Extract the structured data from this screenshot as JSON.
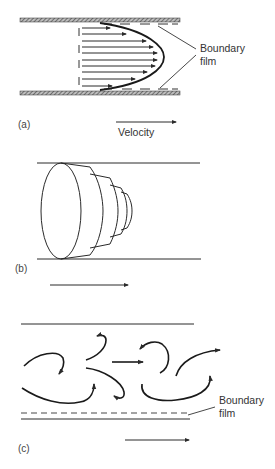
{
  "figure": {
    "panels": [
      {
        "id": "a",
        "label": "(a)",
        "description": "Laminar flow in a pipe: parabolic velocity profile with boundary film at walls",
        "annotation": {
          "line1": "Boundary",
          "line2": "film"
        },
        "velocity_label": "Velocity"
      },
      {
        "id": "b",
        "label": "(b)",
        "description": "Laminar flow shown as telescoping concentric layers moving through the pipe"
      },
      {
        "id": "c",
        "label": "(c)",
        "description": "Turbulent flow with eddies and thin boundary film near the wall",
        "annotation": {
          "line1": "Boundary",
          "line2": "film"
        }
      }
    ],
    "colors": {
      "ink": "#2a2a2a",
      "background": "#ffffff"
    }
  }
}
